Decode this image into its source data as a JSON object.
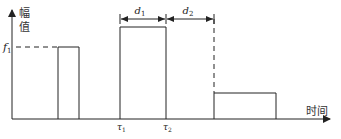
{
  "diagram": {
    "type": "pulse-timing",
    "y_axis_label": "幅值",
    "y_axis_label_chars": [
      "幅",
      "值"
    ],
    "x_axis_label": "时间",
    "amplitude_label": "f",
    "amplitude_sub": "1",
    "tau1_label": "τ",
    "tau1_sub": "1",
    "tau2_label": "τ",
    "tau2_sub": "2",
    "d1_label": "d",
    "d1_sub": "1",
    "d2_label": "d",
    "d2_sub": "2",
    "pulses": [
      {
        "name": "pulse-1",
        "x_start": 58,
        "x_end": 79,
        "top": 47
      },
      {
        "name": "pulse-2",
        "x_start": 120,
        "x_end": 166,
        "top": 27
      },
      {
        "name": "pulse-3",
        "x_start": 214,
        "x_end": 276,
        "top": 93
      }
    ]
  }
}
